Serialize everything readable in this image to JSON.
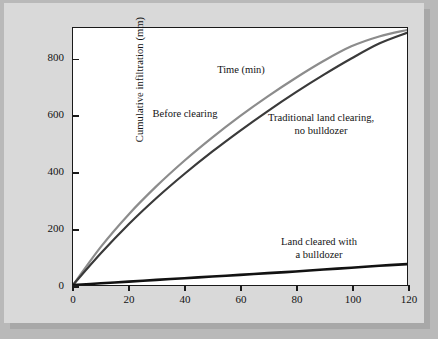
{
  "figure": {
    "background_color": "#b9b9b9",
    "panel_color": "#d9d9d9",
    "plot_background": "#ffffff",
    "frame_color": "#1a1a1a"
  },
  "chart_data": {
    "type": "line",
    "title": "",
    "xlabel": "Time (min)",
    "ylabel": "Cumulative infiltration (mm)",
    "xlim": [
      0,
      120
    ],
    "ylim": [
      0,
      910
    ],
    "xticks": [
      0,
      20,
      40,
      60,
      80,
      100,
      120
    ],
    "yticks": [
      0,
      200,
      400,
      600,
      800
    ],
    "xtick_labels": [
      "0",
      "20",
      "40",
      "60",
      "80",
      "100",
      "120"
    ],
    "ytick_labels": [
      "0",
      "200",
      "400",
      "600",
      "800"
    ],
    "grid": false,
    "legend": "annotations-inline",
    "x": [
      0,
      10,
      20,
      30,
      40,
      50,
      60,
      70,
      80,
      90,
      100,
      110,
      120
    ],
    "series": [
      {
        "name": "Before clearing",
        "color": "#8c8c8c",
        "line_width": 2.2,
        "values": [
          0,
          135,
          250,
          350,
          440,
          522,
          598,
          668,
          733,
          793,
          845,
          880,
          903
        ]
      },
      {
        "name": "Traditional land clearing, no bulldozer",
        "color": "#3a3a3a",
        "line_width": 2.2,
        "values": [
          0,
          112,
          215,
          308,
          393,
          472,
          546,
          616,
          682,
          744,
          802,
          855,
          893
        ]
      },
      {
        "name": "Land cleared with a bulldozer",
        "color": "#121212",
        "line_width": 2.6,
        "values": [
          0,
          6,
          12,
          18,
          24,
          30,
          36,
          42,
          48,
          55,
          61,
          68,
          74
        ]
      }
    ],
    "annotations": [
      {
        "id": "before-clearing",
        "text": "Before clearing",
        "x": 28,
        "y": 660
      },
      {
        "id": "traditional",
        "text": "Traditional land clearing,\nno bulldozer",
        "x": 74,
        "y": 650
      },
      {
        "id": "bulldozer",
        "text": "Land cleared with\na bulldozer",
        "x": 76,
        "y": 215
      }
    ]
  }
}
